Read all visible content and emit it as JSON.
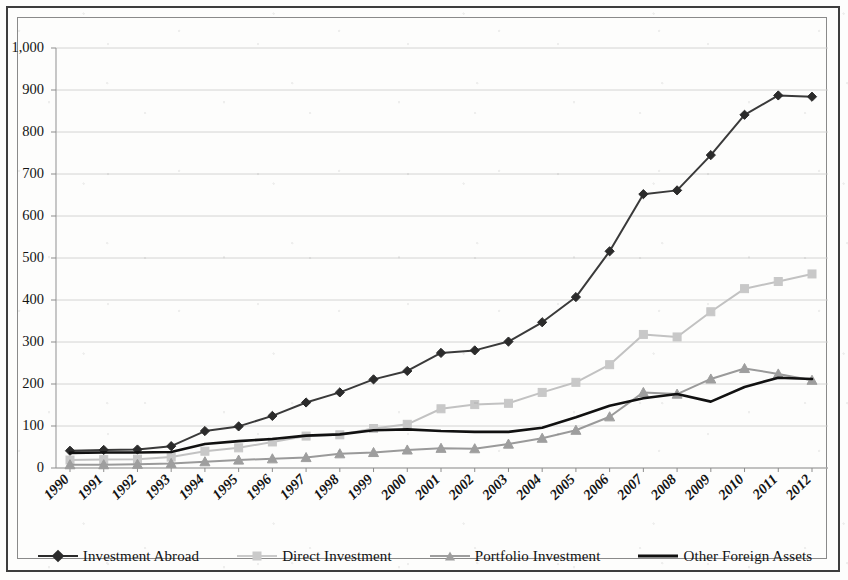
{
  "chart_data": {
    "type": "line",
    "title": "",
    "subtitle": "",
    "xlabel": "",
    "ylabel": "",
    "categories": [
      "1990",
      "1991",
      "1992",
      "1993",
      "1994",
      "1995",
      "1996",
      "1997",
      "1998",
      "1999",
      "2000",
      "2001",
      "2002",
      "2003",
      "2004",
      "2005",
      "2006",
      "2007",
      "2008",
      "2009",
      "2010",
      "2011",
      "2012"
    ],
    "x": [
      1990,
      1991,
      1992,
      1993,
      1994,
      1995,
      1996,
      1997,
      1998,
      1999,
      2000,
      2001,
      2002,
      2003,
      2004,
      2005,
      2006,
      2007,
      2008,
      2009,
      2010,
      2011,
      2012
    ],
    "ylim": [
      0,
      1000
    ],
    "xlim": [
      1990,
      2012
    ],
    "yticks": [
      0,
      100,
      200,
      300,
      400,
      500,
      600,
      700,
      800,
      900,
      1000
    ],
    "ytick_labels": [
      "0",
      "100",
      "200",
      "300",
      "400",
      "500",
      "600",
      "700",
      "800",
      "900",
      "1,000"
    ],
    "grid": true,
    "grid_axis": "y",
    "legend_position": "bottom",
    "series": [
      {
        "name": "Investment Abroad",
        "color": "#3a3a3a",
        "marker": "diamond",
        "marker_color": "#2b2b2b",
        "line_width": 2.0,
        "values": [
          41,
          43,
          44,
          52,
          88,
          99,
          124,
          156,
          180,
          211,
          231,
          274,
          280,
          301,
          347,
          407,
          516,
          652,
          661,
          745,
          841,
          887,
          884
        ]
      },
      {
        "name": "Direct Investment",
        "color": "#c2c2c2",
        "marker": "square",
        "marker_color": "#c8c8c8",
        "line_width": 2.0,
        "values": [
          19,
          20,
          21,
          26,
          40,
          48,
          62,
          76,
          79,
          94,
          104,
          141,
          151,
          154,
          180,
          204,
          246,
          318,
          312,
          372,
          427,
          444,
          462
        ]
      },
      {
        "name": "Portfolio Investment",
        "color": "#9a9a9a",
        "marker": "triangle",
        "marker_color": "#9e9e9e",
        "line_width": 2.0,
        "values": [
          8,
          8,
          9,
          11,
          15,
          19,
          22,
          25,
          34,
          37,
          43,
          47,
          46,
          57,
          71,
          90,
          122,
          180,
          176,
          212,
          237,
          224,
          209
        ]
      },
      {
        "name": "Other Foreign Assets",
        "color": "#111111",
        "marker": "none",
        "marker_color": "#111111",
        "line_width": 2.6,
        "values": [
          36,
          37,
          37,
          38,
          57,
          64,
          69,
          77,
          80,
          90,
          92,
          88,
          86,
          86,
          96,
          121,
          148,
          166,
          176,
          158,
          193,
          215,
          212
        ]
      }
    ]
  },
  "legend": {
    "items": [
      {
        "label": "Investment Abroad",
        "marker": "diamond",
        "color": "#2b2b2b",
        "line_color": "#2b2b2b"
      },
      {
        "label": "Direct Investment",
        "marker": "square",
        "color": "#cacaca",
        "line_color": "#cacaca"
      },
      {
        "label": "Portfolio Investment",
        "marker": "triangle",
        "color": "#9e9e9e",
        "line_color": "#9e9e9e"
      },
      {
        "label": "Other Foreign Assets",
        "marker": "none",
        "color": "#111111",
        "line_color": "#111111"
      }
    ]
  }
}
